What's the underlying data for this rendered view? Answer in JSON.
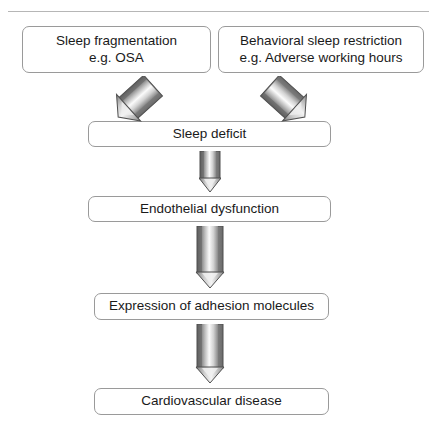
{
  "figure": {
    "page_header": {
      "running_head": "",
      "page_number": ""
    },
    "colors": {
      "box_border": "#9a9a9a",
      "box_fill": "#ffffff",
      "text": "#1a1a1a",
      "arrow_dark": "#6e6e6e",
      "arrow_mid": "#a8a8a8",
      "arrow_light": "#f2f2f2",
      "arrow_outline": "#555555",
      "background": "#ffffff"
    },
    "boxes": [
      {
        "id": "sleep-fragmentation",
        "line1": "Sleep fragmentation",
        "line2": "e.g. OSA"
      },
      {
        "id": "behavioral-sleep-restriction",
        "line1": "Behavioral sleep restriction",
        "line2": "e.g. Adverse working hours"
      },
      {
        "id": "sleep-deficit",
        "line1": "Sleep deficit",
        "line2": ""
      },
      {
        "id": "endothelial-dysfunction",
        "line1": "Endothelial dysfunction",
        "line2": ""
      },
      {
        "id": "adhesion-molecules",
        "line1": "Expression of adhesion molecules",
        "line2": ""
      },
      {
        "id": "cardiovascular-disease",
        "line1": "Cardiovascular disease",
        "line2": ""
      }
    ],
    "arrows": [
      {
        "id": "left-diagonal",
        "icon": "block-arrow-diagonal-down-right-icon",
        "from": "sleep-fragmentation",
        "to": "sleep-deficit",
        "direction": "down-right"
      },
      {
        "id": "right-diagonal",
        "icon": "block-arrow-diagonal-down-left-icon",
        "from": "behavioral-sleep-restriction",
        "to": "sleep-deficit",
        "direction": "down-left"
      },
      {
        "id": "deficit-to-endothelial",
        "icon": "block-arrow-down-icon",
        "from": "sleep-deficit",
        "to": "endothelial-dysfunction",
        "direction": "down"
      },
      {
        "id": "endothelial-to-adhesion",
        "icon": "block-arrow-down-icon",
        "from": "endothelial-dysfunction",
        "to": "adhesion-molecules",
        "direction": "down"
      },
      {
        "id": "adhesion-to-cvd",
        "icon": "block-arrow-down-icon",
        "from": "adhesion-molecules",
        "to": "cardiovascular-disease",
        "direction": "down"
      }
    ]
  }
}
